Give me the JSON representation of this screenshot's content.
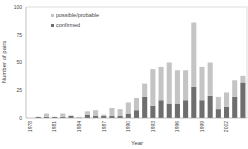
{
  "chart_data": {
    "type": "bar",
    "stacked": true,
    "title": "",
    "xlabel": "Year",
    "ylabel": "Number of pairs",
    "ylim": [
      0,
      100
    ],
    "yticks": [
      0,
      25,
      50,
      75,
      100
    ],
    "xtick_labels": [
      "1978",
      "1981",
      "1984",
      "1987",
      "1990",
      "1993",
      "1996",
      "1999",
      "2002"
    ],
    "grid": false,
    "legend_position": "upper-left",
    "categories": [
      "1978",
      "1979",
      "1980",
      "1981",
      "1982",
      "1983",
      "1984",
      "1985",
      "1986",
      "1987",
      "1988",
      "1989",
      "1990",
      "1991",
      "1992",
      "1993",
      "1994",
      "1995",
      "1996",
      "1997",
      "1998",
      "1999",
      "2000",
      "2001",
      "2002",
      "2003",
      "2004"
    ],
    "series": [
      {
        "name": "confirmed",
        "color": "#6e6e6e",
        "values": [
          0,
          1,
          1,
          1,
          1,
          2,
          0,
          3,
          2,
          2,
          2,
          2,
          4,
          7,
          19,
          11,
          16,
          13,
          13,
          16,
          28,
          16,
          20,
          8,
          10,
          19,
          32
        ]
      },
      {
        "name": "possible/probable",
        "color": "#c4c4c4",
        "values": [
          0,
          0,
          3,
          0,
          3,
          0,
          1,
          3,
          5,
          1,
          7,
          6,
          10,
          11,
          12,
          33,
          30,
          37,
          30,
          27,
          58,
          30,
          30,
          11,
          13,
          15,
          6
        ]
      }
    ],
    "totals": [
      0,
      1,
      4,
      1,
      4,
      2,
      1,
      6,
      7,
      3,
      9,
      8,
      14,
      18,
      31,
      44,
      46,
      50,
      43,
      43,
      86,
      46,
      50,
      19,
      23,
      34,
      38
    ]
  }
}
